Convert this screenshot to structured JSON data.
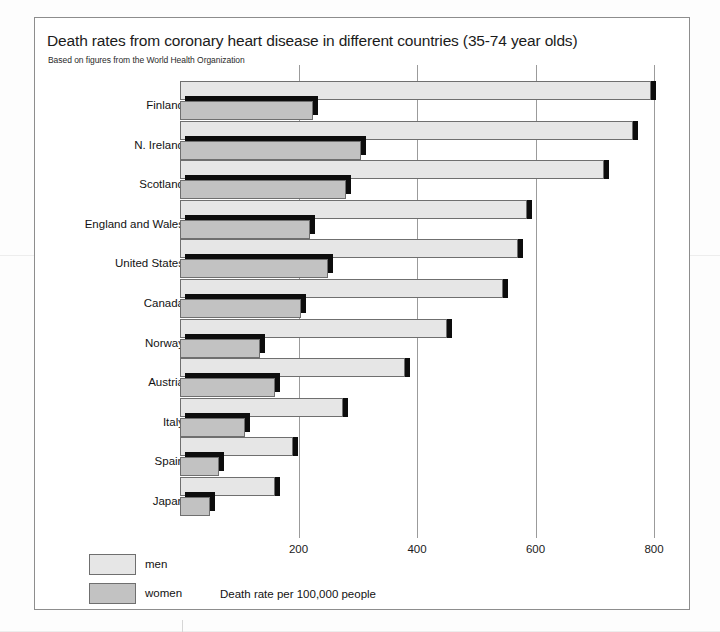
{
  "title": "Death rates from coronary heart disease in different countries (35-74 year olds)",
  "subtitle": "Based on figures from the World Health Organization",
  "axis_caption": "Death rate per 100,000 people",
  "legend": {
    "men_label": "men",
    "women_label": "women"
  },
  "colors": {
    "men": "#e6e6e6",
    "women": "#c2c2c2",
    "shadow": "#0d0d0d",
    "outline": "#6f6f6f",
    "grid": "#9b9b9b",
    "frame": "#8d8d8d",
    "text": "#121212"
  },
  "chart_data": {
    "type": "bar",
    "orientation": "horizontal",
    "title": "Death rates from coronary heart disease in different countries (35-74 year olds)",
    "subtitle": "Based on figures from the World Health Organization",
    "xlabel": "Death rate per 100,000 people",
    "ylabel": "",
    "xlim": [
      0,
      850
    ],
    "xticks": [
      200,
      400,
      600,
      800
    ],
    "xtick_labels": [
      "200",
      "400",
      "600",
      "800"
    ],
    "grid": true,
    "legend_position": "bottom-left",
    "categories": [
      "Finland",
      "N. Ireland",
      "Scotland",
      "England and Wales",
      "United States",
      "Canada",
      "Norway",
      "Austria",
      "Italy",
      "Spain",
      "Japan"
    ],
    "series": [
      {
        "name": "men",
        "values": [
          795,
          765,
          715,
          585,
          570,
          545,
          450,
          380,
          275,
          190,
          160
        ]
      },
      {
        "name": "women",
        "values": [
          225,
          305,
          280,
          220,
          250,
          205,
          135,
          160,
          110,
          65,
          50
        ]
      }
    ]
  }
}
